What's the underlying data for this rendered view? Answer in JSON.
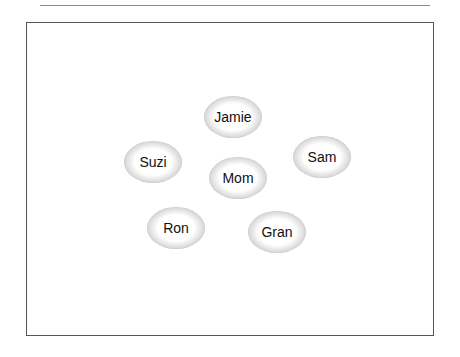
{
  "diagram": {
    "nodes": [
      {
        "id": "jamie",
        "label": "Jamie",
        "x": 233,
        "y": 117
      },
      {
        "id": "suzi",
        "label": "Suzi",
        "x": 153,
        "y": 162
      },
      {
        "id": "sam",
        "label": "Sam",
        "x": 322,
        "y": 157
      },
      {
        "id": "mom",
        "label": "Mom",
        "x": 238,
        "y": 178
      },
      {
        "id": "ron",
        "label": "Ron",
        "x": 176,
        "y": 228
      },
      {
        "id": "gran",
        "label": "Gran",
        "x": 277,
        "y": 232
      }
    ],
    "colors": {
      "frame": "#555555",
      "node_ring": "#000000",
      "node_fill": "#ffffff"
    }
  }
}
